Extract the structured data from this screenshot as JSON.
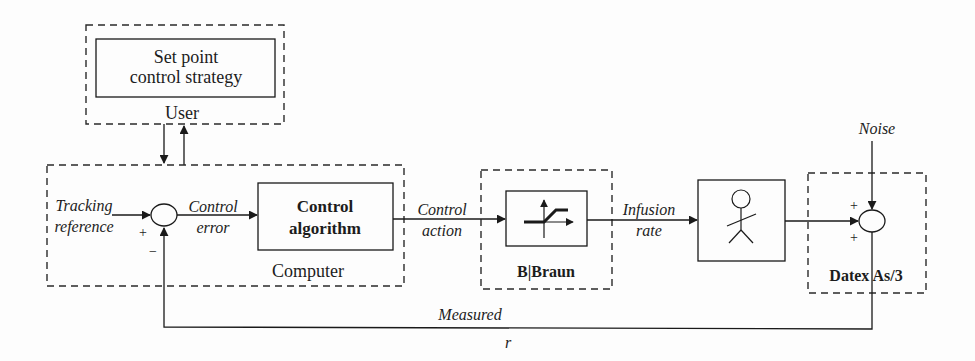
{
  "diagram": {
    "type": "control-loop-block-diagram",
    "colors": {
      "line": "#1a1a1a",
      "dashed_boundary": "#2a2a2a",
      "background": "#fdfdfd"
    },
    "user_group": {
      "label": "User",
      "block": {
        "line1": "Set point",
        "line2": "control strategy"
      }
    },
    "computer_group": {
      "label": "Computer",
      "input_label": {
        "line1": "Tracking",
        "line2": "reference"
      },
      "sum_junction": {
        "plus_sign": "+",
        "minus_sign": "−"
      },
      "error_label": {
        "line1": "Control",
        "line2": "error"
      },
      "block": {
        "line1": "Control",
        "line2": "algorithm"
      }
    },
    "action_label": {
      "line1": "Control",
      "line2": "action"
    },
    "pump_group": {
      "label": "B|Braun",
      "block_icon": "saturation-icon"
    },
    "infusion_label": {
      "line1": "Infusion",
      "line2": "rate"
    },
    "patient_block": {
      "icon": "stick-figure-person-icon"
    },
    "monitor_group": {
      "label": "Datex As/3",
      "noise_label": "Noise",
      "sum_junction": {
        "top_sign": "+",
        "bottom_sign": "+"
      }
    },
    "feedback": {
      "label_line1": "Measured",
      "label_line2": "r"
    }
  }
}
